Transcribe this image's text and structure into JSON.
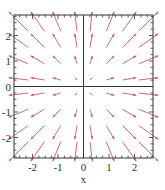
{
  "chart_data": {
    "type": "vector_field",
    "title": "",
    "xlabel": "x",
    "ylabel": "",
    "xlim": [
      -2.75,
      2.75
    ],
    "ylim": [
      -2.75,
      2.75
    ],
    "x_ticks": [
      -2,
      -1,
      0,
      1,
      2
    ],
    "y_ticks": [
      -2,
      -1,
      0,
      1,
      2
    ],
    "x_tick_labels": [
      "-2",
      "-1",
      "0",
      "1",
      "2"
    ],
    "y_tick_labels": [
      "-2",
      "-1",
      "0",
      "1",
      "2"
    ],
    "minor_ticks_per_unit": 4,
    "zero_axes": true,
    "grid": false,
    "legend": null,
    "field": "radial outward, F(x,y) = (x, y)",
    "sample_points": [
      -2.55,
      -1.8,
      -1.05,
      -0.3,
      0.3,
      1.05,
      1.8,
      2.55
    ],
    "arrow_color": "#c0606a",
    "axis_color": "#333333"
  },
  "plot": {
    "frame": {
      "left": 14,
      "top": 15,
      "right": 153,
      "bottom": 158
    },
    "origin_px": {
      "x": 83.5,
      "y": 86.5
    },
    "px_per_unit": 25.5,
    "arrow_scale": 0.3
  }
}
